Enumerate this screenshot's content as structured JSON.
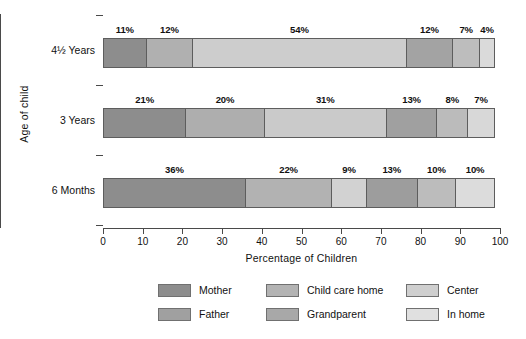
{
  "chart_data": {
    "type": "bar",
    "orientation": "horizontal",
    "stacked": true,
    "normalized_percent": true,
    "title": "",
    "xlabel": "Percentage of Children",
    "ylabel": "Age of child",
    "xlim": [
      0,
      100
    ],
    "xticks": [
      0,
      10,
      20,
      30,
      40,
      50,
      60,
      70,
      80,
      90,
      100
    ],
    "xtick_labels": [
      "0",
      "10",
      "20",
      "30",
      "40",
      "50",
      "60",
      "70",
      "80",
      "90",
      "100"
    ],
    "grid": false,
    "legend_position": "bottom",
    "categories": [
      "4½ Years",
      "3 Years",
      "6 Months"
    ],
    "legend_entries": [
      {
        "name": "Mother",
        "color": "#8d8d8d"
      },
      {
        "name": "Father",
        "color": "#a0a0a0"
      },
      {
        "name": "Child care home",
        "color": "#b3b3b3"
      },
      {
        "name": "Grandparent",
        "color": "#a8a8a8"
      },
      {
        "name": "Center",
        "color": "#cfcfcf"
      },
      {
        "name": "In home",
        "color": "#e0e0e0"
      }
    ],
    "series": [
      {
        "name": "Mother",
        "values": [
          11,
          21,
          36
        ]
      },
      {
        "name": "Father",
        "values": [
          12,
          20,
          22
        ]
      },
      {
        "name": "Child care home",
        "values": [
          54,
          31,
          9
        ]
      },
      {
        "name": "Grandparent",
        "values": [
          12,
          13,
          13
        ]
      },
      {
        "name": "Center",
        "values": [
          7,
          8,
          10
        ]
      },
      {
        "name": "In home",
        "values": [
          4,
          7,
          10
        ]
      }
    ],
    "rows": [
      {
        "category": "4½ Years",
        "segments": [
          {
            "name": "Mother",
            "value": 11,
            "label": "11%",
            "color": "#8d8d8d"
          },
          {
            "name": "Father",
            "value": 12,
            "label": "12%",
            "color": "#b0b0b0"
          },
          {
            "name": "Child care home",
            "value": 54,
            "label": "54%",
            "color": "#cdcdcd"
          },
          {
            "name": "Grandparent",
            "value": 12,
            "label": "12%",
            "color": "#a3a3a3"
          },
          {
            "name": "Center",
            "value": 7,
            "label": "7%",
            "color": "#bdbdbd"
          },
          {
            "name": "In home",
            "value": 4,
            "label": "4%",
            "color": "#dadada"
          }
        ]
      },
      {
        "category": "3 Years",
        "segments": [
          {
            "name": "Mother",
            "value": 21,
            "label": "21%",
            "color": "#8d8d8d"
          },
          {
            "name": "Father",
            "value": 20,
            "label": "20%",
            "color": "#aeaeae"
          },
          {
            "name": "Child care home",
            "value": 31,
            "label": "31%",
            "color": "#cacaca"
          },
          {
            "name": "Grandparent",
            "value": 13,
            "label": "13%",
            "color": "#a0a0a0"
          },
          {
            "name": "Center",
            "value": 8,
            "label": "8%",
            "color": "#bbbbbb"
          },
          {
            "name": "In home",
            "value": 7,
            "label": "7%",
            "color": "#d8d8d8"
          }
        ]
      },
      {
        "category": "6 Months",
        "segments": [
          {
            "name": "Mother",
            "value": 36,
            "label": "36%",
            "color": "#8d8d8d"
          },
          {
            "name": "Father",
            "value": 22,
            "label": "22%",
            "color": "#b2b2b2"
          },
          {
            "name": "Child care home",
            "value": 9,
            "label": "9%",
            "color": "#d2d2d2"
          },
          {
            "name": "Grandparent",
            "value": 13,
            "label": "13%",
            "color": "#9d9d9d"
          },
          {
            "name": "Center",
            "value": 10,
            "label": "10%",
            "color": "#bcbcbc"
          },
          {
            "name": "In home",
            "value": 10,
            "label": "10%",
            "color": "#dcdcdc"
          }
        ]
      }
    ]
  }
}
